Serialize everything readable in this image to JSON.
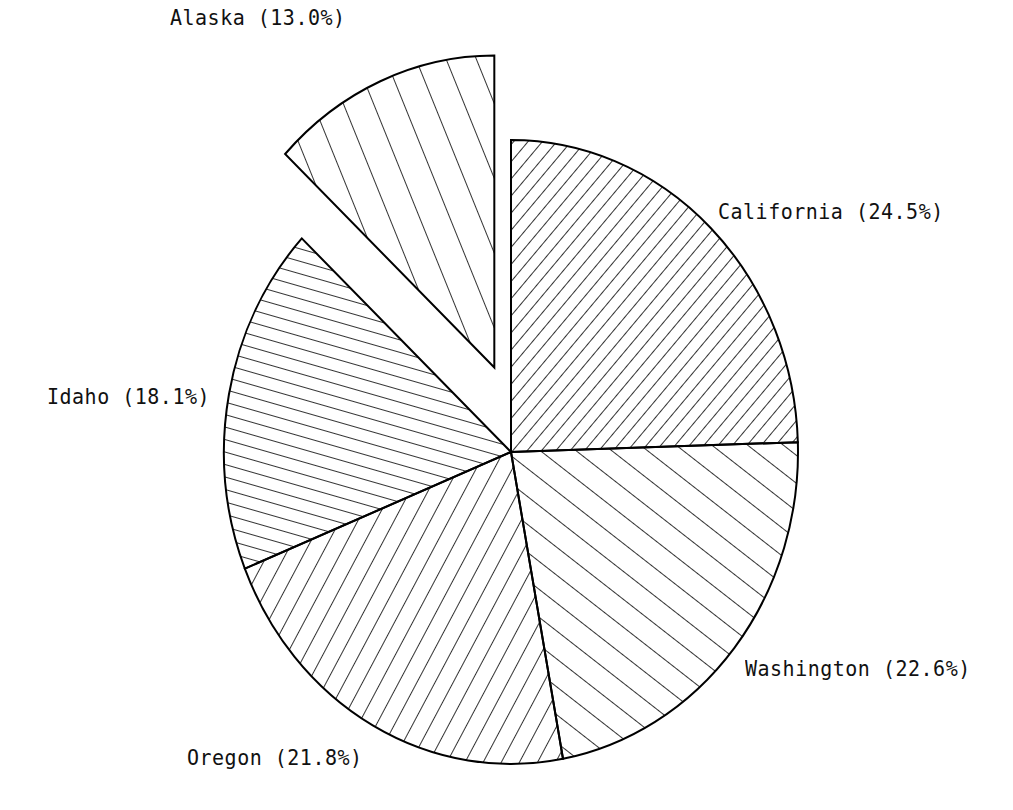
{
  "chart_data": {
    "type": "pie",
    "title": "",
    "start_angle_deg": 0,
    "direction": "clockwise",
    "categories": [
      "California",
      "Washington",
      "Oregon",
      "Idaho",
      "Alaska"
    ],
    "values": [
      24.5,
      22.6,
      21.8,
      18.1,
      13.0
    ],
    "unit": "%",
    "exploded": [
      "Alaska"
    ],
    "slices": [
      {
        "name": "California",
        "value": 24.5,
        "label": "California (24.5%)",
        "hatch_angle": -50,
        "hatch_spacing": 11,
        "explode": 0
      },
      {
        "name": "Washington",
        "value": 22.6,
        "label": "Washington (22.6%)",
        "hatch_angle": 38,
        "hatch_spacing": 22,
        "explode": 0
      },
      {
        "name": "Oregon",
        "value": 21.8,
        "label": "Oregon (21.8%)",
        "hatch_angle": -62,
        "hatch_spacing": 16,
        "explode": 0
      },
      {
        "name": "Idaho",
        "value": 18.1,
        "label": "Idaho (18.1%)",
        "hatch_angle": 16,
        "hatch_spacing": 12,
        "explode": 0
      },
      {
        "name": "Alaska",
        "value": 13.0,
        "label": "Alaska (13.0%)",
        "hatch_angle": 68,
        "hatch_spacing": 28,
        "explode": 1
      }
    ],
    "legend": "none",
    "colors": {
      "stroke": "#000000",
      "background": "#ffffff"
    }
  },
  "labels": {
    "california": "California (24.5%)",
    "washington": "Washington (22.6%)",
    "oregon": "Oregon (21.8%)",
    "idaho": "Idaho (18.1%)",
    "alaska": "Alaska (13.0%)"
  }
}
